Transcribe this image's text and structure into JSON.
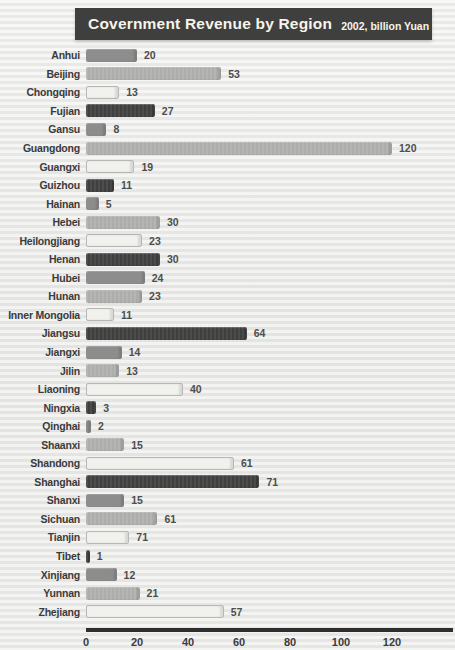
{
  "title": {
    "main": "Covernment Revenue by Region",
    "subtitle": "2002, billion Yuan"
  },
  "colors": {
    "title_bg": "#3f3f3f",
    "title_text": "#f7f4ea",
    "bar_dark": "#3f3f3f",
    "bar_medium": "#8d8d8d",
    "bar_light": "#adadab",
    "bar_xlight": "#f1f1ee",
    "axis_line": "#2e2e2e",
    "background": "#ebebe9"
  },
  "chart_data": {
    "type": "bar",
    "orientation": "horizontal",
    "title": "Covernment Revenue by Region",
    "subtitle": "2002, billion Yuan",
    "xlabel": "",
    "ylabel": "",
    "xlim": [
      0,
      130
    ],
    "x_ticks": [
      0,
      20,
      40,
      60,
      80,
      100,
      120
    ],
    "grid": false,
    "legend": false,
    "px_per_unit": 2.55,
    "categories": [
      "Anhui",
      "Beijing",
      "Chongqing",
      "Fujian",
      "Gansu",
      "Guangdong",
      "Guangxi",
      "Guizhou",
      "Hainan",
      "Hebei",
      "Heilongjiang",
      "Henan",
      "Hubei",
      "Hunan",
      "Inner Mongolia",
      "Jiangsu",
      "Jiangxi",
      "Jilin",
      "Liaoning",
      "Ningxia",
      "Qinghai",
      "Shaanxi",
      "Shandong",
      "Shanghai",
      "Shanxi",
      "Sichuan",
      "Tianjin",
      "Tibet",
      "Xinjiang",
      "Yunnan",
      "Zhejiang"
    ],
    "values": [
      20,
      53,
      13,
      27,
      8,
      120,
      19,
      11,
      5,
      30,
      23,
      30,
      24,
      23,
      11,
      64,
      14,
      13,
      40,
      3,
      2,
      15,
      61,
      71,
      15,
      61,
      71,
      1,
      12,
      21,
      57
    ],
    "regions": [
      {
        "name": "Anhui",
        "value": 20,
        "bar": 20,
        "shade": "medium"
      },
      {
        "name": "Beijing",
        "value": 53,
        "bar": 53,
        "shade": "light"
      },
      {
        "name": "Chongqing",
        "value": 13,
        "bar": 13,
        "shade": "xlight"
      },
      {
        "name": "Fujian",
        "value": 27,
        "bar": 27,
        "shade": "dark"
      },
      {
        "name": "Gansu",
        "value": 8,
        "bar": 8,
        "shade": "medium"
      },
      {
        "name": "Guangdong",
        "value": 120,
        "bar": 120,
        "shade": "light"
      },
      {
        "name": "Guangxi",
        "value": 19,
        "bar": 19,
        "shade": "xlight"
      },
      {
        "name": "Guizhou",
        "value": 11,
        "bar": 11,
        "shade": "dark"
      },
      {
        "name": "Hainan",
        "value": 5,
        "bar": 5,
        "shade": "medium"
      },
      {
        "name": "Hebei",
        "value": 30,
        "bar": 29,
        "shade": "light"
      },
      {
        "name": "Heilongjiang",
        "value": 23,
        "bar": 22,
        "shade": "xlight"
      },
      {
        "name": "Henan",
        "value": 30,
        "bar": 29,
        "shade": "dark"
      },
      {
        "name": "Hubei",
        "value": 24,
        "bar": 23,
        "shade": "medium"
      },
      {
        "name": "Hunan",
        "value": 23,
        "bar": 22,
        "shade": "light"
      },
      {
        "name": "Inner Mongolia",
        "value": 11,
        "bar": 11,
        "shade": "xlight"
      },
      {
        "name": "Jiangsu",
        "value": 64,
        "bar": 63,
        "shade": "dark"
      },
      {
        "name": "Jiangxi",
        "value": 14,
        "bar": 14,
        "shade": "medium"
      },
      {
        "name": "Jilin",
        "value": 13,
        "bar": 13,
        "shade": "light"
      },
      {
        "name": "Liaoning",
        "value": 40,
        "bar": 38,
        "shade": "xlight"
      },
      {
        "name": "Ningxia",
        "value": 3,
        "bar": 4,
        "shade": "dark"
      },
      {
        "name": "Qinghai",
        "value": 2,
        "bar": 2,
        "shade": "medium"
      },
      {
        "name": "Shaanxi",
        "value": 15,
        "bar": 15,
        "shade": "light"
      },
      {
        "name": "Shandong",
        "value": 61,
        "bar": 58,
        "shade": "xlight"
      },
      {
        "name": "Shanghai",
        "value": 71,
        "bar": 68,
        "shade": "dark"
      },
      {
        "name": "Shanxi",
        "value": 15,
        "bar": 15,
        "shade": "medium"
      },
      {
        "name": "Sichuan",
        "value": 61,
        "bar": 28,
        "shade": "light"
      },
      {
        "name": "Tianjin",
        "value": 71,
        "bar": 17,
        "shade": "xlight"
      },
      {
        "name": "Tibet",
        "value": 1,
        "bar": 1.5,
        "shade": "dark"
      },
      {
        "name": "Xinjiang",
        "value": 12,
        "bar": 12,
        "shade": "medium"
      },
      {
        "name": "Yunnan",
        "value": 21,
        "bar": 21,
        "shade": "light"
      },
      {
        "name": "Zhejiang",
        "value": 57,
        "bar": 54,
        "shade": "xlight"
      }
    ]
  }
}
